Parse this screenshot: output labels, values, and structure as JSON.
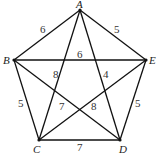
{
  "diagram": {
    "type": "weighted-complete-graph",
    "vertices": [
      {
        "id": "A",
        "label": "A",
        "x": 80,
        "y": 10
      },
      {
        "id": "B",
        "label": "B",
        "x": 14,
        "y": 60
      },
      {
        "id": "C",
        "label": "C",
        "x": 39,
        "y": 140
      },
      {
        "id": "D",
        "label": "D",
        "x": 120,
        "y": 140
      },
      {
        "id": "E",
        "label": "E",
        "x": 146,
        "y": 60
      }
    ],
    "edges": [
      {
        "from": "A",
        "to": "B",
        "weight": "6"
      },
      {
        "from": "A",
        "to": "E",
        "weight": "5"
      },
      {
        "from": "B",
        "to": "E",
        "weight": "6"
      },
      {
        "from": "A",
        "to": "C",
        "weight": "8"
      },
      {
        "from": "A",
        "to": "D",
        "weight": "4"
      },
      {
        "from": "B",
        "to": "C",
        "weight": "5"
      },
      {
        "from": "E",
        "to": "D",
        "weight": "5"
      },
      {
        "from": "B",
        "to": "D",
        "weight": "7"
      },
      {
        "from": "C",
        "to": "E",
        "weight": "8"
      },
      {
        "from": "C",
        "to": "D",
        "weight": "7"
      }
    ]
  }
}
